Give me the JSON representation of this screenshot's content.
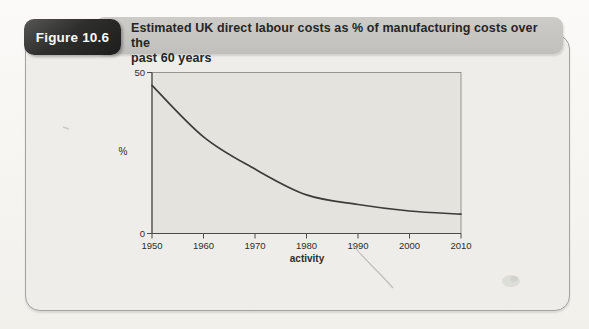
{
  "figure": {
    "badge_label": "Figure 10.6",
    "title": "Estimated UK direct labour costs as % of manufacturing costs over the past 60 years",
    "title_line1": "Estimated UK direct labour costs as % of manufacturing costs over the",
    "title_line2": "past 60 years"
  },
  "chart_data": {
    "type": "line",
    "x": [
      1950,
      1960,
      1970,
      1980,
      1990,
      2000,
      2010
    ],
    "values": [
      46,
      30,
      20,
      12,
      9,
      7,
      6
    ],
    "series_name": "UK direct labour costs as % of manufacturing costs",
    "title": "",
    "xlabel": "activity",
    "ylabel": "%",
    "xlim": [
      1950,
      2010
    ],
    "ylim": [
      0,
      50
    ],
    "yticks": [
      0,
      50
    ],
    "ytick_labels": [
      "0",
      "50"
    ],
    "grid": false,
    "legend": false,
    "line_color": "#3d3c39"
  },
  "palette": {
    "badge_bg": "#2e2e2c",
    "badge_text": "#fbfbfa",
    "title_bar_bg": "#c6c5c2",
    "panel_bg": "#eeede9",
    "plot_bg": "#e4e3de",
    "axis_color": "#4d4c48",
    "page_bg": "#f5f4f0"
  }
}
